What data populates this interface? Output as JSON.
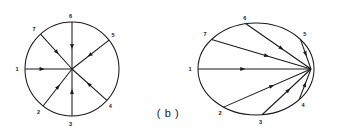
{
  "figure": {
    "caption": "( b )",
    "caption_x": 168,
    "caption_y": 117,
    "stroke_color": "#1a1a1a",
    "background_color": "#ffffff"
  },
  "diagrams": [
    {
      "id": "left-graph",
      "name": "circle-star-graph",
      "shape": "circle",
      "center_x": 72,
      "center_y": 69,
      "radius_x": 47,
      "radius_y": 47,
      "hub_x": 72,
      "hub_y": 69,
      "hub_on_perimeter": false,
      "node_count": 7,
      "nodes": [
        {
          "label": "1",
          "angle_deg": 180,
          "label_dx": -8,
          "label_dy": 1.5,
          "direction": "outward"
        },
        {
          "label": "2",
          "angle_deg": 232,
          "label_dx": -4.5,
          "label_dy": 7.5,
          "direction": "inward"
        },
        {
          "label": "3",
          "angle_deg": 270,
          "label_dx": -1.5,
          "label_dy": 9.5,
          "direction": "inward"
        },
        {
          "label": "4",
          "angle_deg": 318,
          "label_dx": 3.5,
          "label_dy": 8.0,
          "direction": "inward"
        },
        {
          "label": "5",
          "angle_deg": 38,
          "label_dx": 4.0,
          "label_dy": -3.5,
          "direction": "inward"
        },
        {
          "label": "6",
          "angle_deg": 90,
          "label_dx": -1.5,
          "label_dy": -4.0,
          "direction": "inward"
        },
        {
          "label": "7",
          "angle_deg": 132,
          "label_dx": -6.5,
          "label_dy": -3.5,
          "direction": "inward"
        }
      ]
    },
    {
      "id": "right-graph",
      "name": "ellipse-converging-graph",
      "shape": "ellipse",
      "center_x": 256,
      "center_y": 69,
      "radius_x": 58,
      "radius_y": 46,
      "hub_x": 311,
      "hub_y": 69,
      "hub_on_perimeter": true,
      "node_count": 7,
      "nodes": [
        {
          "label": "1",
          "angle_deg": 180,
          "label_dx": -8,
          "label_dy": 1.5,
          "direction": "outward"
        },
        {
          "label": "2",
          "angle_deg": 236,
          "label_dx": -3.5,
          "label_dy": 8.0,
          "direction": "inward"
        },
        {
          "label": "3",
          "angle_deg": 276,
          "label_dx": -1.5,
          "label_dy": 9.5,
          "direction": "inward"
        },
        {
          "label": "4",
          "angle_deg": 318,
          "label_dx": 4.0,
          "label_dy": 7.5,
          "direction": "inward"
        },
        {
          "label": "5",
          "angle_deg": 40,
          "label_dx": 4.5,
          "label_dy": -3.0,
          "direction": "inward"
        },
        {
          "label": "6",
          "angle_deg": 100,
          "label_dx": -1.0,
          "label_dy": -4.0,
          "direction": "inward"
        },
        {
          "label": "7",
          "angle_deg": 140,
          "label_dx": -6.5,
          "label_dy": -3.0,
          "direction": "inward"
        }
      ]
    }
  ]
}
